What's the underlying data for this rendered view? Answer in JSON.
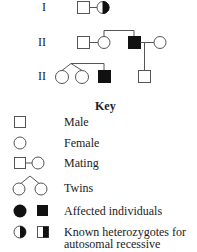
{
  "pedigree": {
    "generations": [
      {
        "label": "I"
      },
      {
        "label": "II"
      },
      {
        "label": "II"
      }
    ]
  },
  "key": {
    "title": "Key",
    "items": [
      {
        "symbol": "male-square-icon",
        "label": "Male"
      },
      {
        "symbol": "female-circle-icon",
        "label": "Female"
      },
      {
        "symbol": "mating-icon",
        "label": "Mating"
      },
      {
        "symbol": "twins-icon",
        "label": "Twins"
      },
      {
        "symbol": "affected-icon",
        "label": "Affected individuals"
      },
      {
        "symbol": "heterozygote-icon",
        "label": "Known heterozygotes for",
        "label2": "autosomal recessive"
      }
    ]
  },
  "colors": {
    "line": "#555555",
    "fill": "#111111",
    "background": "#ffffff"
  }
}
